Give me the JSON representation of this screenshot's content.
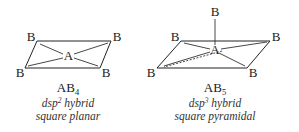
{
  "figures": [
    {
      "id": "ab4",
      "central_atom": "A",
      "ligand_label": "B",
      "formula_main": "AB",
      "formula_sub": "4",
      "hybridization_prefix": "dsp",
      "hybridization_sup": "2",
      "hybridization_suffix": " hybrid",
      "geometry": "square planar"
    },
    {
      "id": "ab5",
      "central_atom": "A",
      "ligand_label": "B",
      "formula_main": "AB",
      "formula_sub": "5",
      "hybridization_prefix": "dsp",
      "hybridization_sup": "3",
      "hybridization_suffix": " hybrid",
      "geometry": "square pyramidal"
    }
  ]
}
